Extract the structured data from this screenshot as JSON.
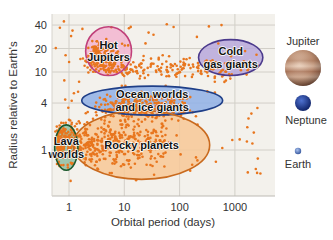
{
  "chart_data": {
    "type": "scatter",
    "title": "",
    "xlabel": "Orbital period (days)",
    "ylabel": "Radius relative to Earth's",
    "xscale": "log",
    "yscale": "log",
    "xlim": [
      0.5,
      6000
    ],
    "ylim": [
      0.35,
      50
    ],
    "xticks": [
      {
        "value": 1,
        "label": "1"
      },
      {
        "value": 10,
        "label": "10"
      },
      {
        "value": 100,
        "label": "100"
      },
      {
        "value": 1000,
        "label": "1000"
      }
    ],
    "yticks": [
      {
        "value": 40,
        "label": "40"
      },
      {
        "value": 20,
        "label": "20"
      },
      {
        "value": 10,
        "label": "10"
      },
      {
        "value": 4,
        "label": "4"
      },
      {
        "value": 1,
        "label": "1"
      }
    ],
    "grid": true,
    "point_color": "#e8761e",
    "point_clusters": [
      {
        "name": "rocky",
        "x_range": [
          0.6,
          60
        ],
        "y_range": [
          0.5,
          3
        ],
        "count": 520
      },
      {
        "name": "ocean",
        "x_range": [
          1,
          300
        ],
        "y_range": [
          2,
          6
        ],
        "count": 260
      },
      {
        "name": "hot-jupiters",
        "x_range": [
          1.5,
          10
        ],
        "y_range": [
          8,
          30
        ],
        "count": 160
      },
      {
        "name": "warm-giants",
        "x_range": [
          5,
          2000
        ],
        "y_range": [
          7,
          18
        ],
        "count": 190
      },
      {
        "name": "sparse",
        "x_range": [
          0.55,
          3000
        ],
        "y_range": [
          0.4,
          45
        ],
        "count": 120
      }
    ],
    "regions": [
      {
        "label": [
          "Hot",
          "Jupiters"
        ],
        "center": [
          5.5,
          19
        ],
        "xspan": [
          2.0,
          13.5
        ],
        "yspan": [
          9,
          38
        ],
        "fill": "#f2b5d0",
        "stroke": "#c0407a"
      },
      {
        "label": [
          "Cold",
          "gas giants"
        ],
        "center": [
          900,
          15
        ],
        "xspan": [
          220,
          3200
        ],
        "yspan": [
          9,
          26
        ],
        "fill": "#b7a8dc",
        "stroke": "#4b3a8c"
      },
      {
        "label": [
          "Ocean worlds",
          "and ice giants"
        ],
        "center": [
          35,
          4.3
        ],
        "xspan": [
          1.7,
          600
        ],
        "yspan": [
          2.8,
          6.6
        ],
        "fill": "#8fb0e6",
        "stroke": "#1f3f88"
      },
      {
        "label": [
          "Lava",
          "worlds"
        ],
        "center": [
          0.85,
          1.05
        ],
        "xspan": [
          0.55,
          1.45
        ],
        "yspan": [
          0.55,
          2.1
        ],
        "fill": "#8fc0a4",
        "stroke": "#1d5a2e"
      },
      {
        "label": [
          "Rocky planets"
        ],
        "center": [
          20,
          1.25
        ],
        "xspan": [
          1.2,
          350
        ],
        "yspan": [
          0.42,
          3.2
        ],
        "fill": "#f7c897",
        "stroke": "#c96a1e"
      }
    ],
    "reference_planets": [
      {
        "name": "Jupiter",
        "color": "#b88a6e"
      },
      {
        "name": "Neptune",
        "color": "#213e96"
      },
      {
        "name": "Earth",
        "color": "#5a7cc0"
      }
    ]
  }
}
